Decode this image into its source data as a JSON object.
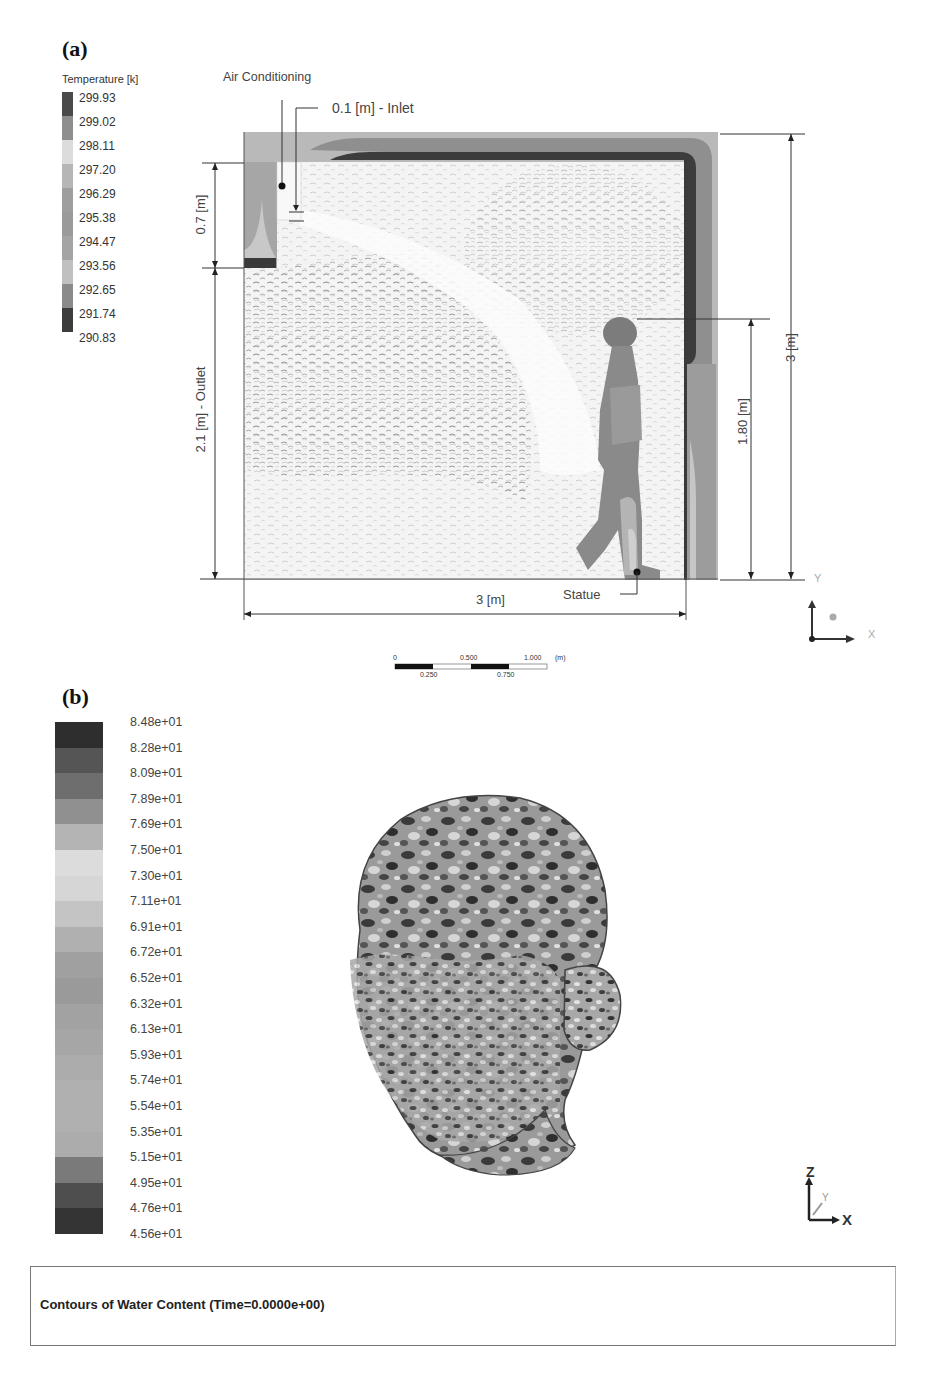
{
  "panel_a": {
    "label": "(a)",
    "legend": {
      "title": "Temperature [k]",
      "values": [
        "299.93",
        "299.02",
        "298.11",
        "297.20",
        "296.29",
        "295.38",
        "294.47",
        "293.56",
        "292.65",
        "291.74",
        "290.83"
      ],
      "colors": [
        "#4a4a4a",
        "#8e8e8e",
        "#dcdcdc",
        "#b6b6b6",
        "#9e9e9e",
        "#9a9a9a",
        "#a4a4a4",
        "#b8b8b8",
        "#8a8a8a",
        "#3c3c3c"
      ]
    },
    "annotations": {
      "air_conditioning": "Air Conditioning",
      "inlet": "0.1 [m] - Inlet",
      "ac_height": "0.7 [m]",
      "outlet": "2.1 [m] - Outlet",
      "room_height": "3 [m]",
      "person_height": "1.80 [m]",
      "room_width": "3 [m]",
      "statue": "Statue"
    },
    "scale_bar": {
      "top_labels": [
        "0",
        "0.500",
        "1.000",
        "(m)"
      ],
      "bottom_labels": [
        "0.250",
        "0.750"
      ]
    },
    "axes": {
      "vertical": "Y",
      "horizontal": "X"
    }
  },
  "panel_b": {
    "label": "(b)",
    "legend": {
      "values": [
        "8.48e+01",
        "8.28e+01",
        "8.09e+01",
        "7.89e+01",
        "7.69e+01",
        "7.50e+01",
        "7.30e+01",
        "7.11e+01",
        "6.91e+01",
        "6.72e+01",
        "6.52e+01",
        "6.32e+01",
        "6.13e+01",
        "5.93e+01",
        "5.74e+01",
        "5.54e+01",
        "5.35e+01",
        "5.15e+01",
        "4.95e+01",
        "4.76e+01",
        "4.56e+01"
      ],
      "colors": [
        "#2e2e2e",
        "#555555",
        "#6e6e6e",
        "#909090",
        "#b4b4b4",
        "#dcdcdc",
        "#d6d6d6",
        "#c4c4c4",
        "#b0b0b0",
        "#a0a0a0",
        "#9a9a9a",
        "#a2a2a2",
        "#a6a6a6",
        "#acacac",
        "#b0b0b0",
        "#b0b0b0",
        "#acacac",
        "#7a7a7a",
        "#4e4e4e",
        "#343434"
      ]
    },
    "axes": {
      "vertical": "Z",
      "horizontal": "X",
      "depth": "Y"
    },
    "caption": "Contours of Water Content  (Time=0.0000e+00)"
  }
}
